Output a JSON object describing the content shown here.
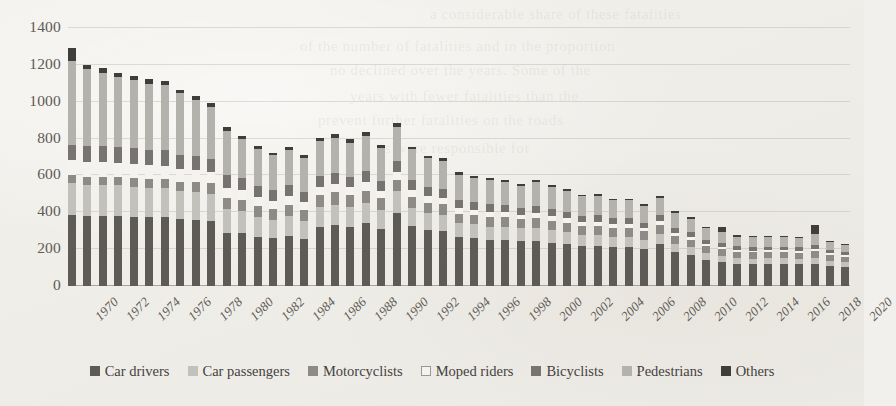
{
  "chart_data": {
    "type": "bar",
    "subtype": "stacked-bar",
    "title": "",
    "xlabel": "",
    "ylabel": "",
    "ylim": [
      0,
      1400
    ],
    "ytick_step": 200,
    "yticks": [
      1400,
      1200,
      1000,
      800,
      600,
      400,
      200,
      0
    ],
    "grid": true,
    "legend_position": "bottom",
    "x_label_interval": 2,
    "categories": [
      1970,
      1971,
      1972,
      1973,
      1974,
      1975,
      1976,
      1977,
      1978,
      1979,
      1980,
      1981,
      1982,
      1983,
      1984,
      1985,
      1986,
      1987,
      1988,
      1989,
      1990,
      1991,
      1992,
      1993,
      1994,
      1995,
      1996,
      1997,
      1998,
      1999,
      2000,
      2001,
      2002,
      2003,
      2004,
      2005,
      2006,
      2007,
      2008,
      2009,
      2010,
      2011,
      2012,
      2013,
      2014,
      2015,
      2016,
      2017,
      2018,
      2019,
      2020
    ],
    "x_tick_labels": [
      "1970",
      "1972",
      "1974",
      "1976",
      "1978",
      "1980",
      "1982",
      "1984",
      "1986",
      "1988",
      "1990",
      "1992",
      "1994",
      "1996",
      "1998",
      "2000",
      "2002",
      "2004",
      "2006",
      "2008",
      "2010",
      "2012",
      "2014",
      "2016",
      "2018",
      "2020"
    ],
    "series": [
      {
        "name": "Car drivers",
        "color": "#5e5b57",
        "values": [
          385,
          378,
          378,
          378,
          375,
          372,
          372,
          362,
          360,
          355,
          288,
          285,
          268,
          258,
          270,
          255,
          320,
          330,
          322,
          340,
          310,
          395,
          325,
          305,
          300,
          265,
          260,
          250,
          250,
          245,
          245,
          235,
          230,
          215,
          215,
          210,
          210,
          200,
          230,
          185,
          170,
          140,
          130,
          120,
          118,
          120,
          120,
          118,
          120,
          110,
          105
        ]
      },
      {
        "name": "Car passengers",
        "color": "#c3c1bc",
        "values": [
          175,
          172,
          170,
          168,
          165,
          162,
          160,
          152,
          148,
          142,
          128,
          120,
          108,
          102,
          108,
          100,
          110,
          112,
          108,
          112,
          105,
          120,
          98,
          90,
          88,
          78,
          75,
          72,
          72,
          68,
          72,
          68,
          65,
          62,
          60,
          55,
          55,
          48,
          55,
          45,
          42,
          38,
          35,
          32,
          30,
          30,
          30,
          28,
          30,
          26,
          25
        ]
      },
      {
        "name": "Motorcyclists",
        "color": "#8e8b86",
        "values": [
          42,
          44,
          46,
          46,
          48,
          48,
          50,
          52,
          58,
          60,
          62,
          62,
          60,
          58,
          60,
          58,
          62,
          66,
          62,
          66,
          60,
          62,
          58,
          55,
          55,
          50,
          50,
          52,
          50,
          48,
          52,
          50,
          48,
          48,
          52,
          50,
          50,
          48,
          48,
          42,
          40,
          38,
          36,
          34,
          34,
          34,
          34,
          34,
          38,
          32,
          30
        ]
      },
      {
        "name": "Moped riders",
        "color": "#f4f3f0",
        "values": [
          80,
          80,
          78,
          78,
          76,
          74,
          72,
          68,
          66,
          62,
          56,
          52,
          48,
          46,
          48,
          44,
          46,
          46,
          44,
          46,
          42,
          44,
          40,
          38,
          36,
          32,
          30,
          30,
          28,
          26,
          28,
          26,
          24,
          22,
          22,
          20,
          20,
          18,
          18,
          16,
          14,
          12,
          12,
          10,
          10,
          10,
          10,
          10,
          12,
          9,
          8
        ]
      },
      {
        "name": "Bicyclists",
        "color": "#767370",
        "values": [
          85,
          86,
          86,
          84,
          84,
          82,
          82,
          78,
          76,
          72,
          68,
          66,
          60,
          58,
          60,
          56,
          58,
          58,
          56,
          58,
          54,
          56,
          52,
          48,
          48,
          44,
          42,
          42,
          40,
          38,
          40,
          38,
          36,
          34,
          34,
          32,
          32,
          30,
          32,
          28,
          26,
          24,
          22,
          20,
          20,
          20,
          20,
          20,
          22,
          18,
          16
        ]
      },
      {
        "name": "Pedestrians",
        "color": "#b4b2ad",
        "values": [
          455,
          420,
          398,
          380,
          370,
          360,
          355,
          335,
          300,
          280,
          240,
          212,
          198,
          188,
          192,
          182,
          190,
          192,
          186,
          192,
          178,
          188,
          168,
          158,
          152,
          136,
          130,
          128,
          125,
          118,
          125,
          118,
          112,
          105,
          105,
          98,
          98,
          92,
          96,
          82,
          72,
          62,
          58,
          52,
          52,
          52,
          52,
          50,
          58,
          44,
          40
        ]
      },
      {
        "name": "Others",
        "color": "#403e3b",
        "values": [
          68,
          22,
          26,
          22,
          20,
          24,
          22,
          18,
          22,
          20,
          22,
          18,
          16,
          14,
          18,
          16,
          20,
          20,
          18,
          20,
          18,
          22,
          16,
          14,
          14,
          12,
          12,
          12,
          12,
          11,
          12,
          11,
          10,
          10,
          10,
          10,
          10,
          8,
          10,
          8,
          8,
          8,
          30,
          8,
          8,
          8,
          8,
          8,
          50,
          8,
          6
        ]
      }
    ],
    "totals": [
      1290,
      1202,
      1182,
      1156,
      1138,
      1122,
      1113,
      1065,
      1030,
      991,
      864,
      815,
      758,
      724,
      756,
      711,
      806,
      824,
      796,
      834,
      767,
      887,
      757,
      708,
      693,
      617,
      599,
      586,
      577,
      554,
      574,
      546,
      525,
      496,
      498,
      475,
      475,
      446,
      489,
      406,
      372,
      322,
      323,
      276,
      272,
      274,
      274,
      268,
      330,
      247,
      230
    ]
  },
  "legend": {
    "items": [
      {
        "label": "Car drivers",
        "color": "#5e5b57",
        "outline": false
      },
      {
        "label": "Car passengers",
        "color": "#c3c1bc",
        "outline": false
      },
      {
        "label": "Motorcyclists",
        "color": "#8e8b86",
        "outline": false
      },
      {
        "label": "Moped riders",
        "color": "#f4f3f0",
        "outline": true
      },
      {
        "label": "Bicyclists",
        "color": "#767370",
        "outline": false
      },
      {
        "label": "Pedestrians",
        "color": "#b4b2ad",
        "outline": false
      },
      {
        "label": "Others",
        "color": "#403e3b",
        "outline": false
      }
    ]
  },
  "page_background": {
    "bleed_text": [
      "a considerable share of these fatalities",
      "of the number of fatalities and in the proportion",
      "no declined over the years. Some of the",
      "years with fewer fatalities than the",
      "prevent further fatalities on the roads",
      "is were responsible for"
    ]
  },
  "colors": {
    "background": "#f2f0ec",
    "grid": "#969288",
    "axis_text": "#5f5b55",
    "legend_text": "#44413d"
  }
}
